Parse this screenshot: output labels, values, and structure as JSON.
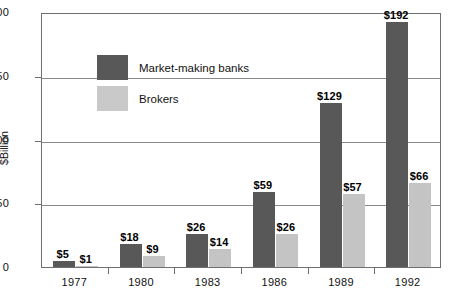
{
  "chart_data": {
    "type": "bar",
    "title": "",
    "xlabel": "",
    "ylabel": "$Billion",
    "ylim": [
      0,
      200
    ],
    "yticks": [
      0,
      50,
      100,
      150,
      200
    ],
    "ytick_labels": [
      "0",
      "50",
      "100",
      "150",
      "200"
    ],
    "grid": true,
    "legend_position": "upper-left inside plot",
    "categories": [
      "1977",
      "1980",
      "1983",
      "1986",
      "1989",
      "1992"
    ],
    "series": [
      {
        "name": "Market-making banks",
        "color": "#585858",
        "values": [
          5,
          18,
          26,
          59,
          129,
          192
        ],
        "data_labels": [
          "$5",
          "$18",
          "$26",
          "$59",
          "$129",
          "$192"
        ]
      },
      {
        "name": "Brokers",
        "color": "#c4c4c4",
        "values": [
          1,
          9,
          14,
          26,
          57,
          66
        ],
        "data_labels": [
          "$1",
          "$9",
          "$14",
          "$26",
          "$57",
          "$66"
        ]
      }
    ]
  },
  "legend": {
    "items": [
      {
        "label": "Market-making banks",
        "swatch": "dark"
      },
      {
        "label": "Brokers",
        "swatch": "light"
      }
    ]
  },
  "colors": {
    "bar_dark": "#585858",
    "bar_light": "#c4c4c4",
    "axis": "#6f6f6f",
    "gridline": "#8a8a8a",
    "background": "#ffffff"
  }
}
